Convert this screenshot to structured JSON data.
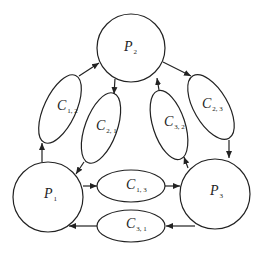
{
  "diagram": {
    "type": "process-channel graph",
    "nodes": [
      {
        "id": "P2",
        "label": "P",
        "sub": "2",
        "shape": "circle"
      },
      {
        "id": "P1",
        "label": "P",
        "sub": "1",
        "shape": "circle"
      },
      {
        "id": "P3",
        "label": "P",
        "sub": "3",
        "shape": "circle"
      }
    ],
    "channels": [
      {
        "id": "C12",
        "label": "C",
        "sub": "1, 2",
        "from": "P1",
        "to": "P2"
      },
      {
        "id": "C21",
        "label": "C",
        "sub": "2, 1",
        "from": "P2",
        "to": "P1"
      },
      {
        "id": "C32",
        "label": "C",
        "sub": "3, 2",
        "from": "P3",
        "to": "P2"
      },
      {
        "id": "C23",
        "label": "C",
        "sub": "2, 3",
        "from": "P2",
        "to": "P3"
      },
      {
        "id": "C13",
        "label": "C",
        "sub": "1, 3",
        "from": "P1",
        "to": "P3"
      },
      {
        "id": "C31",
        "label": "C",
        "sub": "3, 1",
        "from": "P3",
        "to": "P1"
      }
    ],
    "colors": {
      "stroke": "#222222",
      "background": "#ffffff"
    }
  }
}
